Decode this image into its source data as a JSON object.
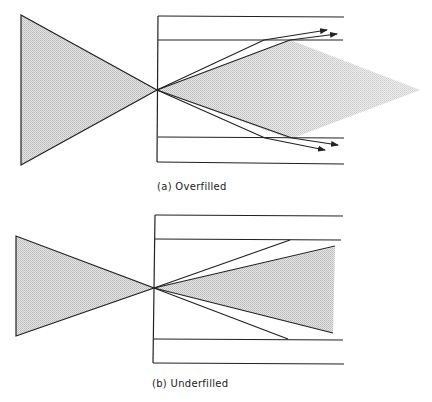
{
  "diagrams": [
    {
      "id": "a",
      "caption": "(a) Overfilled",
      "description": "Input cone larger than fiber acceptance: outer rays escape through cladding",
      "colors": {
        "fill": "#d4d4d4",
        "stroke": "#222222"
      }
    },
    {
      "id": "b",
      "caption": "(b) Underfilled",
      "description": "Input cone smaller than fiber acceptance: rays stay within core",
      "colors": {
        "fill": "#d4d4d4",
        "stroke": "#222222"
      }
    }
  ]
}
